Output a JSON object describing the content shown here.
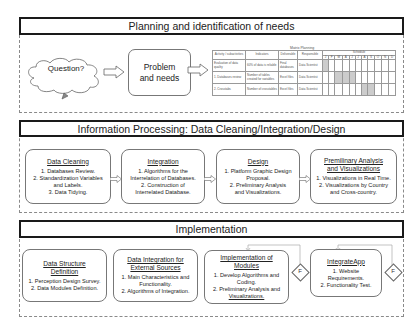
{
  "sections": [
    {
      "title": "Planning and identification of needs",
      "cloud_label": "Question?",
      "problem_label": "Problem and needs",
      "matrix": {
        "title": "Matrix Planning",
        "headers": [
          "Activity / subactivities",
          "Indicators",
          "Deliverable",
          "Responsible"
        ],
        "schedule_label": "Schedule",
        "months": [
          "J",
          "F",
          "M",
          "A",
          "J",
          "J",
          "A",
          "S",
          "O",
          "N",
          "D"
        ],
        "rows": [
          {
            "activity": "Evaluation of data quality",
            "indicator": "60% of data is reliable",
            "deliverable": "Final databases",
            "responsible": "Data Scientist",
            "active": [
              0
            ]
          },
          {
            "activity": "1. Databases review",
            "indicator": "Number of tables created for variables",
            "deliverable": "Excel files",
            "responsible": "Data Scientist",
            "active": [
              2,
              3,
              4
            ]
          },
          {
            "activity": "2. Crosstabs",
            "indicator": "Number of crosstables",
            "deliverable": "Excel files",
            "responsible": "Data Scientist",
            "active": [
              6,
              7
            ]
          }
        ]
      }
    },
    {
      "title": "Information Processing: Data Cleaning/Integration/Design",
      "boxes": [
        {
          "title": "Data Cleaning",
          "items": [
            "1. Databases Review.",
            "2. Standardization Variables",
            "and Labels.",
            "3. Data Tidying."
          ]
        },
        {
          "title": "Integration",
          "items": [
            "1. Algorithms for the",
            "Interrelation of Databases.",
            "2. Construction of",
            "Interrelated Database."
          ]
        },
        {
          "title": "Design",
          "items": [
            "1. Platform Graphic Design",
            "Proposal.",
            "2. Preliminary Analysis",
            "and Visualizations."
          ]
        },
        {
          "title": "Premilinary Analysis and Visualizations",
          "items": [
            "1. Visualizations in Real Time.",
            "2. Visualizations by Country",
            "and Cross-country."
          ]
        }
      ]
    },
    {
      "title": "Implementation",
      "boxes": [
        {
          "title": "Data Structure Definition",
          "items": [
            "1. Perception Design Survey.",
            "2. Data Modules Definition."
          ]
        },
        {
          "title": "Data Integration for External Sources",
          "items": [
            "1. Main Characteristics and",
            "Functionality.",
            "2. Algorithms of Integration."
          ]
        },
        {
          "title": "Implementation of Modules",
          "items": [
            "1. Develop Algorithms and",
            "Coding.",
            "2. Preliminary Analysis and",
            "Visualizations."
          ]
        },
        {
          "title": "IntegrateApp",
          "items": [
            "1. Website",
            "Requirements.",
            "2. Functionality Test."
          ]
        }
      ],
      "feedback_label": "F"
    }
  ]
}
